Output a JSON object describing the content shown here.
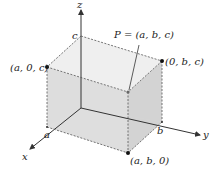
{
  "diagram": {
    "type": "3d-coordinate-box",
    "axes": {
      "x_label": "x",
      "y_label": "y",
      "z_label": "z"
    },
    "axis_ticks": {
      "a": "a",
      "b": "b",
      "c": "c"
    },
    "points": {
      "p_label": "P = (a, b, c)",
      "a0c": "(a, 0, c)",
      "0bc": "(0, b, c)",
      "ab0": "(a, b, 0)"
    },
    "colors": {
      "face_light": "#e6e6e6",
      "face_mid": "#d9d9d9",
      "face_top": "#eeeeee",
      "line": "#333333",
      "dashed": "#555555"
    }
  }
}
